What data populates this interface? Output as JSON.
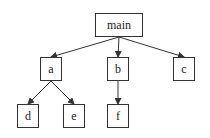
{
  "diagram": {
    "type": "tree",
    "nodes": [
      {
        "id": "main",
        "label": "main",
        "x": 95,
        "y": 13,
        "w": 48,
        "h": 24
      },
      {
        "id": "a",
        "label": "a",
        "x": 40,
        "y": 57,
        "w": 22,
        "h": 24
      },
      {
        "id": "b",
        "label": "b",
        "x": 107,
        "y": 57,
        "w": 22,
        "h": 24
      },
      {
        "id": "c",
        "label": "c",
        "x": 173,
        "y": 57,
        "w": 22,
        "h": 24
      },
      {
        "id": "d",
        "label": "d",
        "x": 17,
        "y": 104,
        "w": 22,
        "h": 24
      },
      {
        "id": "e",
        "label": "e",
        "x": 63,
        "y": 104,
        "w": 22,
        "h": 24
      },
      {
        "id": "f",
        "label": "f",
        "x": 107,
        "y": 104,
        "w": 22,
        "h": 24
      }
    ],
    "edges": [
      {
        "from": "main",
        "to": "a"
      },
      {
        "from": "main",
        "to": "b"
      },
      {
        "from": "main",
        "to": "c"
      },
      {
        "from": "a",
        "to": "d"
      },
      {
        "from": "a",
        "to": "e"
      },
      {
        "from": "b",
        "to": "f"
      }
    ],
    "colors": {
      "stroke": "#333333",
      "background": "#ffffff",
      "text": "#222222"
    }
  }
}
